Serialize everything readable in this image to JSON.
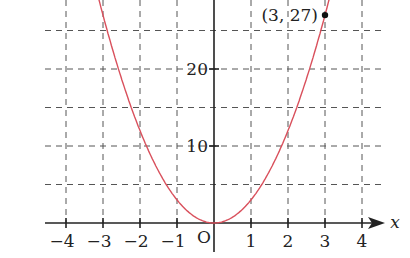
{
  "chart_data": {
    "type": "line",
    "title": "",
    "function": "y = 3x^2",
    "xlabel": "x",
    "ylabel": "",
    "origin_label": "O",
    "x_ticks": [
      "-4",
      "-3",
      "-2",
      "-1",
      "1",
      "2",
      "3",
      "4"
    ],
    "y_ticks": [
      "10",
      "20"
    ],
    "xlim": [
      -4.4,
      4.6
    ],
    "ylim": [
      -1,
      29
    ],
    "grid": "dashed, x every 1, y every 5",
    "series": [
      {
        "name": "y = 3x^2",
        "color": "#d9505c",
        "x": [
          -3.1,
          -3,
          -2,
          -1,
          0,
          1,
          2,
          3,
          3.1
        ],
        "values": [
          28.83,
          27,
          12,
          3,
          0,
          3,
          12,
          27,
          28.83
        ]
      }
    ],
    "annotations": [
      {
        "label": "(3, 27)",
        "x": 3,
        "y": 27,
        "marker": "filled-dot"
      }
    ]
  }
}
